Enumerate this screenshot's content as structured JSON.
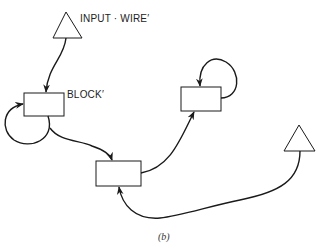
{
  "diagram": {
    "labels": {
      "input_wire": "INPUT · WIRE′",
      "block": "BLOCK′"
    },
    "caption": "(b)",
    "nodes": [
      {
        "id": "input-wire-triangle",
        "shape": "triangle"
      },
      {
        "id": "block-1",
        "shape": "rectangle",
        "label": "BLOCK′"
      },
      {
        "id": "block-2",
        "shape": "rectangle"
      },
      {
        "id": "block-3",
        "shape": "rectangle"
      },
      {
        "id": "triangle-2",
        "shape": "triangle"
      }
    ],
    "edges": [
      {
        "from": "input-wire-triangle",
        "to": "block-1"
      },
      {
        "from": "block-1",
        "to": "block-1",
        "type": "loop"
      },
      {
        "from": "block-1",
        "to": "block-2"
      },
      {
        "from": "block-2",
        "to": "block-3"
      },
      {
        "from": "block-3",
        "to": "block-3",
        "type": "loop"
      },
      {
        "from": "triangle-2",
        "to": "block-2"
      }
    ],
    "colors": {
      "stroke": "#1a1a1a",
      "background": "#ffffff"
    }
  }
}
